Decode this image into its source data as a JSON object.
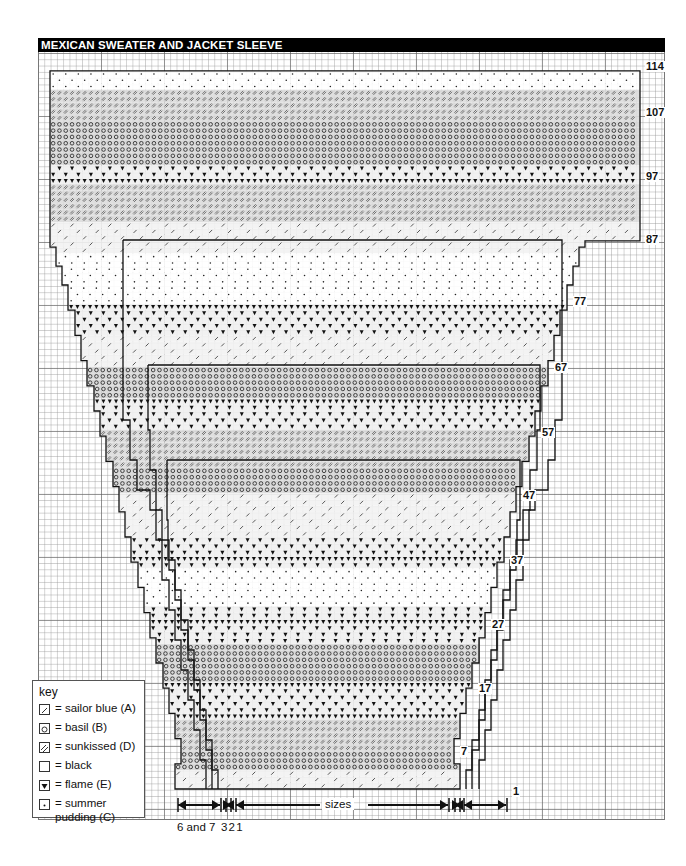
{
  "title": "MEXICAN SWEATER AND JACKET SLEEVE",
  "row_labels": [
    {
      "label": "114",
      "y": 67
    },
    {
      "label": "107",
      "y": 113
    },
    {
      "label": "97",
      "y": 177
    },
    {
      "label": "87",
      "y": 240
    },
    {
      "label": "77",
      "y": 302
    },
    {
      "label": "67",
      "y": 368
    },
    {
      "label": "57",
      "y": 433
    },
    {
      "label": "47",
      "y": 496
    },
    {
      "label": "37",
      "y": 561
    },
    {
      "label": "27",
      "y": 625
    },
    {
      "label": "17",
      "y": 689
    },
    {
      "label": "7",
      "y": 752
    },
    {
      "label": "1",
      "y": 792
    }
  ],
  "key": {
    "heading": "key",
    "items": [
      {
        "symbol": "slash",
        "label": "= sailor blue (A)"
      },
      {
        "symbol": "diamond",
        "label": "= basil (B)"
      },
      {
        "symbol": "double-slash",
        "label": "= sunkissed (D)"
      },
      {
        "symbol": "blank",
        "label": "= black"
      },
      {
        "symbol": "triangle",
        "label": "= flame (E)"
      },
      {
        "symbol": "dot",
        "label": "= summer pudding (C)"
      }
    ]
  },
  "bottom": {
    "size_label_left": "6 and 7",
    "size_label_nums": "3 2 1",
    "sizes_label": "sizes"
  },
  "bands": [
    {
      "from": 114,
      "to": 112,
      "symbol": "dot"
    },
    {
      "from": 111,
      "to": 107,
      "symbol": "double-slash"
    },
    {
      "from": 106,
      "to": 100,
      "symbol": "diamond"
    },
    {
      "from": 99,
      "to": 97,
      "symbol": "triangle"
    },
    {
      "from": 96,
      "to": 91,
      "symbol": "double-slash"
    },
    {
      "from": 90,
      "to": 86,
      "symbol": "slash"
    },
    {
      "from": 85,
      "to": 78,
      "symbol": "dot"
    },
    {
      "from": 77,
      "to": 73,
      "symbol": "triangle"
    },
    {
      "from": 72,
      "to": 68,
      "symbol": "slash"
    },
    {
      "from": 67,
      "to": 63,
      "symbol": "diamond"
    },
    {
      "from": 62,
      "to": 58,
      "symbol": "triangle"
    },
    {
      "from": 57,
      "to": 52,
      "symbol": "double-slash"
    },
    {
      "from": 51,
      "to": 48,
      "symbol": "diamond"
    },
    {
      "from": 47,
      "to": 41,
      "symbol": "slash"
    },
    {
      "from": 40,
      "to": 36,
      "symbol": "triangle"
    },
    {
      "from": 35,
      "to": 30,
      "symbol": "dot"
    },
    {
      "from": 29,
      "to": 24,
      "symbol": "triangle"
    },
    {
      "from": 23,
      "to": 18,
      "symbol": "diamond"
    },
    {
      "from": 17,
      "to": 12,
      "symbol": "triangle"
    },
    {
      "from": 11,
      "to": 7,
      "symbol": "double-slash"
    },
    {
      "from": 6,
      "to": 4,
      "symbol": "diamond"
    },
    {
      "from": 3,
      "to": 1,
      "symbol": "slash"
    }
  ]
}
